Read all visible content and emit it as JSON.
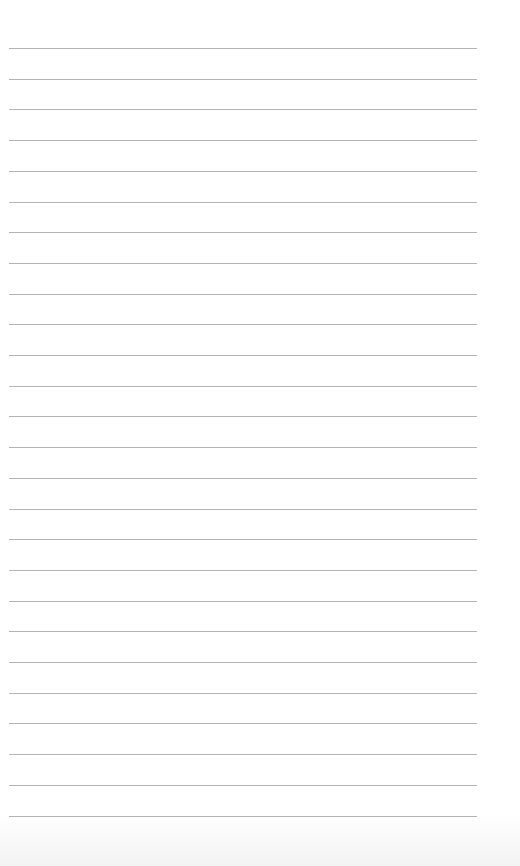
{
  "page": {
    "type": "lined-paper",
    "background": "#ffffff",
    "line_color": "#9a9a9a",
    "line_count": 26,
    "first_line_y": 48,
    "line_spacing": 30.7,
    "line_left": 9,
    "line_right": 477
  }
}
